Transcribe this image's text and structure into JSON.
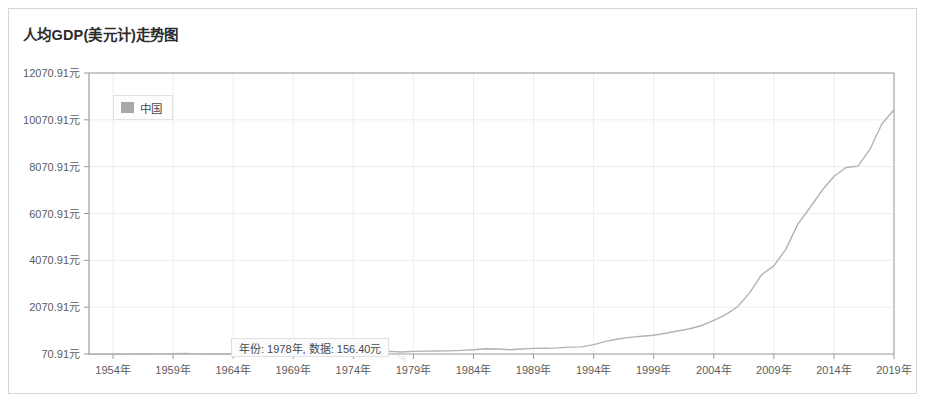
{
  "header": {
    "title": "人均GDP(美元计)走势图"
  },
  "legend": {
    "items": [
      {
        "label": "中国",
        "color": "#a8a8a8"
      }
    ],
    "position": "top-left"
  },
  "tooltip": {
    "visible": true,
    "text": "年份: 1978年, 数据: 156.40元",
    "year_label": "1978年",
    "value_label": "156.40元",
    "year": 1978,
    "value": 156.4
  },
  "colors": {
    "line": "#b3b3b3",
    "grid": "#ededed",
    "axis": "#9a9a9a",
    "border": "#d6d6d6",
    "text": "#5c5c5c",
    "title": "#2b2b2b"
  },
  "chart_data": {
    "type": "line",
    "title": "人均GDP(美元计)走势图",
    "xlabel": "",
    "ylabel": "",
    "grid": true,
    "legend_position": "top-left",
    "xlim": [
      1952,
      2019
    ],
    "ylim": [
      70.91,
      12070.91
    ],
    "ytick_labels": [
      "70.91元",
      "2070.91元",
      "4070.91元",
      "6070.91元",
      "8070.91元",
      "10070.91元",
      "12070.91元"
    ],
    "yticks": [
      70.91,
      2070.91,
      4070.91,
      6070.91,
      8070.91,
      10070.91,
      12070.91
    ],
    "xtick_labels": [
      "1954年",
      "1959年",
      "1964年",
      "1969年",
      "1974年",
      "1979年",
      "1984年",
      "1989年",
      "1994年",
      "1999年",
      "2004年",
      "2009年",
      "2014年",
      "2019年"
    ],
    "xticks": [
      1954,
      1959,
      1964,
      1969,
      1974,
      1979,
      1984,
      1989,
      1994,
      1999,
      2004,
      2009,
      2014,
      2019
    ],
    "series": [
      {
        "name": "中国",
        "color": "#b3b3b3",
        "x": [
          1952,
          1953,
          1954,
          1955,
          1956,
          1957,
          1958,
          1959,
          1960,
          1961,
          1962,
          1963,
          1964,
          1965,
          1966,
          1967,
          1968,
          1969,
          1970,
          1971,
          1972,
          1973,
          1974,
          1975,
          1976,
          1977,
          1978,
          1979,
          1980,
          1981,
          1982,
          1983,
          1984,
          1985,
          1986,
          1987,
          1988,
          1989,
          1990,
          1991,
          1992,
          1993,
          1994,
          1995,
          1996,
          1997,
          1998,
          1999,
          2000,
          2001,
          2002,
          2003,
          2004,
          2005,
          2006,
          2007,
          2008,
          2009,
          2010,
          2011,
          2012,
          2013,
          2014,
          2015,
          2016,
          2017,
          2018,
          2019
        ],
        "values": [
          53.0,
          60.0,
          61.0,
          63.0,
          68.0,
          70.0,
          77.0,
          84.0,
          90.0,
          75.0,
          70.0,
          74.0,
          84.0,
          98.0,
          104.0,
          96.0,
          91.0,
          100.0,
          113.0,
          118.0,
          131.0,
          157.0,
          160.0,
          178.0,
          165.0,
          185.0,
          156.4,
          184.0,
          195.0,
          197.0,
          204.0,
          225.0,
          250.0,
          294.0,
          282.0,
          251.0,
          283.0,
          310.0,
          317.0,
          333.0,
          366.0,
          377.0,
          473.0,
          610.0,
          709.0,
          781.0,
          828.0,
          873.0,
          959.0,
          1053.0,
          1148.0,
          1288.0,
          1508.0,
          1753.0,
          2099.0,
          2693.0,
          3468.0,
          3832.0,
          4550.0,
          5618.0,
          6317.0,
          7051.0,
          7651.0,
          8034.0,
          8094.0,
          8817.0,
          9905.0,
          10500.0
        ]
      }
    ]
  }
}
